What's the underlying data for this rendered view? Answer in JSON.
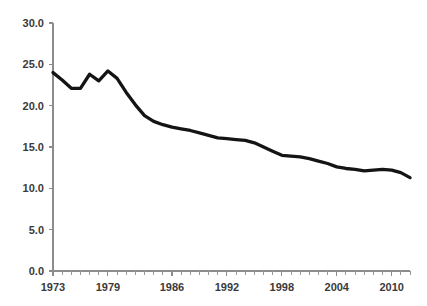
{
  "chart_data": {
    "type": "line",
    "title": "",
    "subtitle": "",
    "xlabel": "",
    "ylabel": "",
    "xlim": [
      1973,
      2012
    ],
    "ylim": [
      0.0,
      30.0
    ],
    "grid": false,
    "legend": false,
    "legend_position": "none",
    "line_color": "#141414",
    "axis_color": "#8c8c8c",
    "text_color": "#3a3a3a",
    "background_color": "#ffffff",
    "y_ticks": [
      0.0,
      5.0,
      10.0,
      15.0,
      20.0,
      25.0,
      30.0
    ],
    "y_tick_labels": [
      "0.0",
      "5.0",
      "10.0",
      "15.0",
      "20.0",
      "25.0",
      "30.0"
    ],
    "x_ticks": [
      1973,
      1979,
      1986,
      1992,
      1998,
      2004,
      2010
    ],
    "x_tick_labels": [
      "1973",
      "1979",
      "1986",
      "1992",
      "1998",
      "2004",
      "2010"
    ],
    "x_minor_tick_interval": 1,
    "x": [
      1973,
      1974,
      1975,
      1976,
      1977,
      1978,
      1979,
      1980,
      1981,
      1982,
      1983,
      1984,
      1985,
      1986,
      1987,
      1988,
      1989,
      1990,
      1991,
      1992,
      1993,
      1994,
      1995,
      1996,
      1997,
      1998,
      1999,
      2000,
      2001,
      2002,
      2003,
      2004,
      2005,
      2006,
      2007,
      2008,
      2009,
      2010,
      2011,
      2012
    ],
    "values": [
      24.0,
      23.1,
      22.1,
      22.1,
      23.8,
      23.0,
      24.2,
      23.3,
      21.6,
      20.1,
      18.8,
      18.1,
      17.7,
      17.4,
      17.2,
      17.0,
      16.7,
      16.4,
      16.1,
      16.0,
      15.9,
      15.8,
      15.5,
      15.0,
      14.5,
      14.0,
      13.9,
      13.8,
      13.6,
      13.3,
      13.0,
      12.6,
      12.4,
      12.3,
      12.1,
      12.2,
      12.3,
      12.2,
      11.9,
      11.3
    ],
    "series": [
      {
        "name": "series-1",
        "values": [
          24.0,
          23.1,
          22.1,
          22.1,
          23.8,
          23.0,
          24.2,
          23.3,
          21.6,
          20.1,
          18.8,
          18.1,
          17.7,
          17.4,
          17.2,
          17.0,
          16.7,
          16.4,
          16.1,
          16.0,
          15.9,
          15.8,
          15.5,
          15.0,
          14.5,
          14.0,
          13.9,
          13.8,
          13.6,
          13.3,
          13.0,
          12.6,
          12.4,
          12.3,
          12.1,
          12.2,
          12.3,
          12.2,
          11.9,
          11.3
        ]
      }
    ],
    "annotations": []
  },
  "plot_geometry": {
    "left": 53,
    "right": 410,
    "top": 23,
    "bottom": 271
  }
}
